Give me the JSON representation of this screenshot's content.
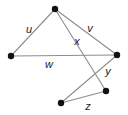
{
  "diagram": {
    "type": "undirected-graph",
    "canvas": {
      "width": 128,
      "height": 115,
      "background": "#ffffff"
    },
    "style": {
      "edge_color": "#8d8d8d",
      "vertex_color": "#111111",
      "label_color": "#1a1a1a",
      "edge_width": 1.1,
      "vertex_radius": 3.2
    },
    "vertices": [
      {
        "id": "A",
        "x": 55,
        "y": 9
      },
      {
        "id": "B",
        "x": 11,
        "y": 56
      },
      {
        "id": "C",
        "x": 117,
        "y": 55
      },
      {
        "id": "D",
        "x": 61,
        "y": 103
      },
      {
        "id": "E",
        "x": 106,
        "y": 91
      }
    ],
    "edges": [
      {
        "id": "e-u",
        "label": "u",
        "from": "A",
        "to": "B",
        "x1": 55,
        "y1": 9,
        "x2": 11,
        "y2": 56,
        "label_x": 29,
        "label_y": 29
      },
      {
        "id": "e-v",
        "label": "v",
        "from": "A",
        "to": "C",
        "x1": 55,
        "y1": 9,
        "x2": 117,
        "y2": 55,
        "label_x": 90,
        "label_y": 28
      },
      {
        "id": "e-w",
        "label": "w",
        "from": "B",
        "to": "C",
        "x1": 11,
        "y1": 56,
        "x2": 117,
        "y2": 55,
        "label_x": 49,
        "label_y": 64
      },
      {
        "id": "e-x",
        "label": "x",
        "from": "A",
        "to": "D",
        "x1": 55,
        "y1": 9,
        "x2": 106,
        "y2": 91,
        "label_x": 77,
        "label_y": 41
      },
      {
        "id": "e-y",
        "label": "y",
        "from": "C",
        "to": "D",
        "x1": 117,
        "y1": 55,
        "x2": 61,
        "y2": 103,
        "label_x": 108,
        "label_y": 71
      },
      {
        "id": "e-z",
        "label": "z",
        "from": "D",
        "to": "E",
        "x1": 61,
        "y1": 103,
        "x2": 106,
        "y2": 91,
        "label_x": 88,
        "label_y": 106
      }
    ],
    "labels": {
      "u": "u",
      "v": "v",
      "w": "w",
      "x": "x",
      "y": "y",
      "z": "z"
    }
  }
}
